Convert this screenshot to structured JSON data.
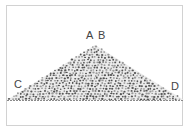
{
  "diagram": {
    "labels": {
      "a": "A",
      "b": "B",
      "c": "C",
      "d": "D"
    },
    "colors": {
      "frame": "#d2d2d2",
      "grain_dark": "#555555",
      "grain_light": "#9a9a9a",
      "pile_fill": "#e6e6e6",
      "label": "#444444"
    }
  }
}
